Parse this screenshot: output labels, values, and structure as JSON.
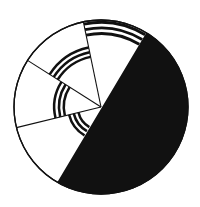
{
  "diagram": {
    "type": "segmented-circle",
    "center": [
      101,
      107
    ],
    "radius": 87,
    "colors": {
      "ink": "#111111",
      "paper": "#ffffff"
    },
    "black_half": {
      "from_point": [
        148,
        30
      ],
      "to_point": [
        58,
        181
      ]
    },
    "divider_lines": [
      {
        "to": [
          83,
          20
        ]
      },
      {
        "to": [
          27,
          60
        ]
      },
      {
        "to": [
          19,
          127
        ]
      }
    ],
    "sectors": [
      {
        "name": "top",
        "stripe_count": 3,
        "inner_r": 72,
        "outer_r": 86
      },
      {
        "name": "upper-left",
        "stripe_count": 3,
        "inner_r": 50,
        "outer_r": 62
      },
      {
        "name": "left",
        "stripe_count": 3,
        "inner_r": 36,
        "outer_r": 48
      },
      {
        "name": "lower-left",
        "stripe_count": 3,
        "inner_r": 22,
        "outer_r": 34
      }
    ]
  }
}
